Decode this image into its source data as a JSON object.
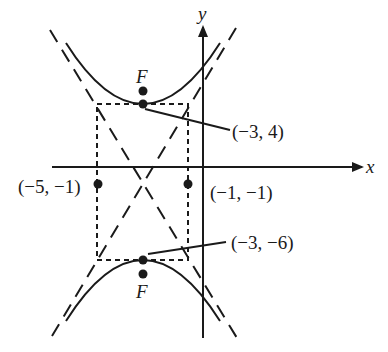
{
  "diagram": {
    "type": "hyperbola",
    "axes": {
      "x_label": "x",
      "y_label": "y"
    },
    "points": {
      "upper_vertex": "(−3, 4)",
      "lower_vertex": "(−3, −6)",
      "left_rect_point": "(−5, −1)",
      "right_rect_point": "(−1, −1)"
    },
    "foci": {
      "upper_label": "F",
      "lower_label": "F"
    },
    "colors": {
      "ink": "#1a1a1a",
      "background": "#ffffff"
    }
  }
}
